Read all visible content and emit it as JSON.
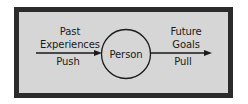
{
  "diagram": {
    "left": {
      "line1": "Past",
      "line2": "Experiences",
      "below": "Push"
    },
    "center": {
      "label": "Person"
    },
    "right": {
      "line1": "Future",
      "line2": "Goals",
      "below": "Pull"
    },
    "colors": {
      "frame_border": "#2b2b2b",
      "frame_fill": "#d6d6d6",
      "ink": "#1a1a1a"
    }
  }
}
